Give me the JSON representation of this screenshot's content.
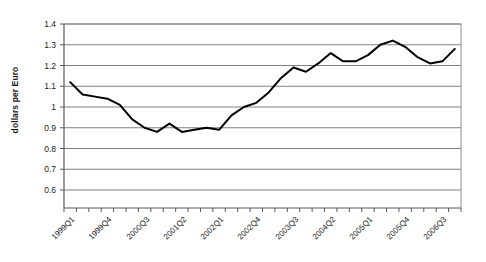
{
  "chart_data": {
    "type": "line",
    "title": "",
    "xlabel": "",
    "ylabel": "dollars per Euro",
    "ylim": [
      0.6,
      1.4
    ],
    "ytick_labels": [
      "1.4",
      "1.3",
      "1.2",
      "1.1",
      "1",
      "0.9",
      "0.8",
      "0.7",
      "0.6"
    ],
    "ytick_values": [
      1.4,
      1.3,
      1.2,
      1.1,
      1.0,
      0.9,
      0.8,
      0.7,
      0.6
    ],
    "grid": true,
    "legend": "none",
    "line_color": "#000000",
    "gridline_color": "#808080",
    "axis_color": "#595959",
    "categories": [
      "1999Q1",
      "1999Q2",
      "1999Q3",
      "1999Q4",
      "2000Q1",
      "2000Q2",
      "2000Q3",
      "2000Q4",
      "2001Q1",
      "2001Q2",
      "2001Q3",
      "2001Q4",
      "2002Q1",
      "2002Q2",
      "2002Q3",
      "2002Q4",
      "2003Q1",
      "2003Q2",
      "2003Q3",
      "2003Q4",
      "2004Q1",
      "2004Q2",
      "2004Q3",
      "2004Q4",
      "2005Q1",
      "2005Q2",
      "2005Q3",
      "2005Q4",
      "2006Q1",
      "2006Q2",
      "2006Q3",
      "2006Q4"
    ],
    "xtick_labels_shown": [
      "1999Q1",
      "1999Q4",
      "2000Q3",
      "2001Q2",
      "2002Q1",
      "2002Q4",
      "2003Q3",
      "2004Q2",
      "2005Q1",
      "2005Q4",
      "2006Q3"
    ],
    "xtick_label_indices": [
      0,
      3,
      6,
      9,
      12,
      15,
      18,
      21,
      24,
      27,
      30
    ],
    "values": [
      1.12,
      1.06,
      1.05,
      1.04,
      1.01,
      0.94,
      0.9,
      0.88,
      0.92,
      0.88,
      0.89,
      0.9,
      0.89,
      0.96,
      1.0,
      1.02,
      1.07,
      1.14,
      1.19,
      1.17,
      1.21,
      1.26,
      1.22,
      1.22,
      1.25,
      1.3,
      1.32,
      1.29,
      1.24,
      1.21,
      1.22,
      1.28
    ],
    "series": [
      {
        "name": "dollars per Euro",
        "values": [
          1.12,
          1.06,
          1.05,
          1.04,
          1.01,
          0.94,
          0.9,
          0.88,
          0.92,
          0.88,
          0.89,
          0.9,
          0.89,
          0.96,
          1.0,
          1.02,
          1.07,
          1.14,
          1.19,
          1.17,
          1.21,
          1.26,
          1.22,
          1.22,
          1.25,
          1.3,
          1.32,
          1.29,
          1.24,
          1.21,
          1.22,
          1.28
        ]
      }
    ]
  },
  "layout": {
    "plot_left": 64,
    "plot_right": 461,
    "plot_top": 24,
    "plot_bottom": 208
  }
}
